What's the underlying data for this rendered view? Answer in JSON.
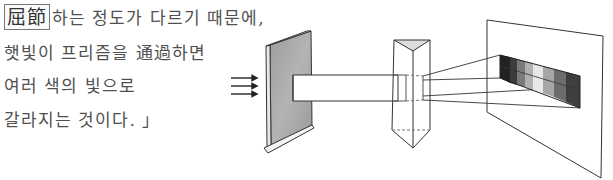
{
  "text": {
    "hanja_term": "屈節",
    "line1_rest": "하는 정도가 다르기 때문에,",
    "line2": "햇빛이 프리즘을 通過하면",
    "line3": "여러 색의 빛으로",
    "line4": "갈라지는 것이다. 」"
  },
  "diagram": {
    "elements": [
      "incoming-light-arrows",
      "slit-screen",
      "light-beam",
      "triangular-prism",
      "projection-screen",
      "color-spectrum-band"
    ],
    "spectrum_shades": [
      "#2a2a2a",
      "#4a4a4a",
      "#8a8a8a",
      "#b8b8b8",
      "#e6e6e6",
      "#9a9a9a",
      "#6a6a6a",
      "#3a3a3a"
    ],
    "colors": {
      "line": "#222222",
      "slit_screen_fill": "#a8a8a8",
      "prism_top": "#d8d8d8"
    }
  }
}
